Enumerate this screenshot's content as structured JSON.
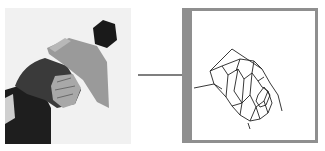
{
  "figure": {
    "left_panel": {
      "type": "photo",
      "subject": "person bending forward wearing a cap with a pompom",
      "colors": {
        "background": "#f1f1f1",
        "cap": "#9a9a9a",
        "pompom": "#1a1a1a",
        "hair": "#3a3a3a",
        "body": "#1e1e1e"
      }
    },
    "arrow": {
      "direction": "right",
      "color": "#555555"
    },
    "right_panel": {
      "type": "line-drawing sketch",
      "frame_color": "#8f8f8f",
      "stroke_color": "#222222"
    }
  }
}
